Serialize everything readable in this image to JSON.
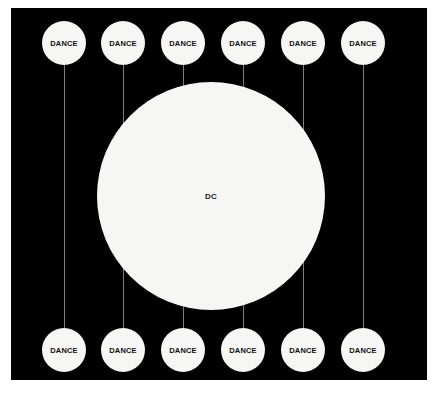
{
  "diagram": {
    "background_color": "#ffffff",
    "panel_color": "#000000",
    "node_color": "#f6f6f4",
    "line_color": "#7d7d7d",
    "text_color": "#111111",
    "hub": {
      "label": "DC",
      "cx": 200,
      "cy": 188,
      "r": 114
    },
    "top_nodes": [
      {
        "label": "DANCE",
        "cx": 53,
        "cy": 35,
        "r": 22
      },
      {
        "label": "DANCE",
        "cx": 112,
        "cy": 35,
        "r": 22
      },
      {
        "label": "DANCE",
        "cx": 172,
        "cy": 35,
        "r": 22
      },
      {
        "label": "DANCE",
        "cx": 232,
        "cy": 35,
        "r": 22
      },
      {
        "label": "DANCE",
        "cx": 292,
        "cy": 35,
        "r": 22
      },
      {
        "label": "DANCE",
        "cx": 352,
        "cy": 35,
        "r": 22
      }
    ],
    "bottom_nodes": [
      {
        "label": "DANCE",
        "cx": 53,
        "cy": 342,
        "r": 22
      },
      {
        "label": "DANCE",
        "cx": 112,
        "cy": 342,
        "r": 22
      },
      {
        "label": "DANCE",
        "cx": 172,
        "cy": 342,
        "r": 22
      },
      {
        "label": "DANCE",
        "cx": 232,
        "cy": 342,
        "r": 22
      },
      {
        "label": "DANCE",
        "cx": 292,
        "cy": 342,
        "r": 22
      },
      {
        "label": "DANCE",
        "cx": 352,
        "cy": 342,
        "r": 22
      }
    ],
    "connectors": [
      {
        "x": 53,
        "y1": 57,
        "y2": 320
      },
      {
        "x": 112,
        "y1": 57,
        "y2": 320
      },
      {
        "x": 172,
        "y1": 57,
        "y2": 320
      },
      {
        "x": 232,
        "y1": 57,
        "y2": 320
      },
      {
        "x": 292,
        "y1": 57,
        "y2": 320
      },
      {
        "x": 352,
        "y1": 57,
        "y2": 320
      }
    ]
  }
}
